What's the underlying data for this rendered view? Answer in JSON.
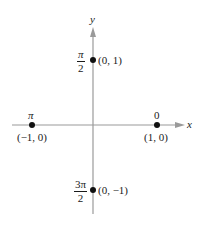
{
  "diagram": {
    "axes": {
      "x_label": "x",
      "y_label": "y",
      "axis_color": "#9a9a9a"
    },
    "points": [
      {
        "id": "top",
        "coord": "(0, 1)",
        "angle_num": "π",
        "angle_den": "2"
      },
      {
        "id": "left",
        "coord": "(−1, 0)",
        "angle": "π"
      },
      {
        "id": "right",
        "coord": "(1, 0)",
        "angle": "0"
      },
      {
        "id": "bottom",
        "coord": "(0, −1)",
        "angle_num": "3π",
        "angle_den": "2"
      }
    ],
    "point_color": "#111111"
  }
}
